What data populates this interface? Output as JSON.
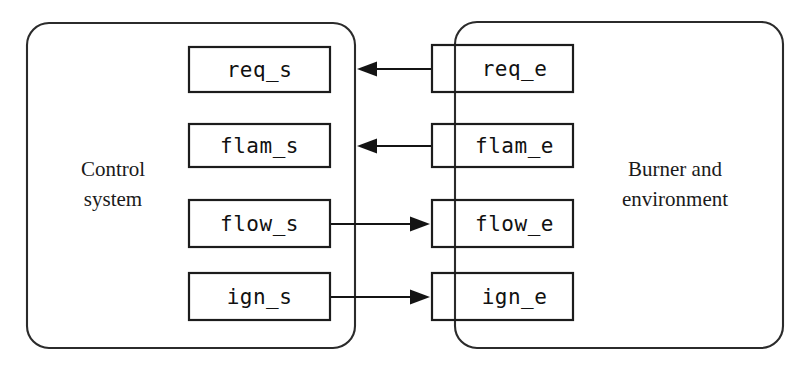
{
  "diagram": {
    "background_color": "#ffffff",
    "line_color": "#141414",
    "text_color": "#111111",
    "containers": [
      {
        "id": "control-system",
        "label_line1": "Control",
        "label_line2": "system",
        "x": 27,
        "y": 23,
        "width": 328,
        "height": 325,
        "radius": 22,
        "label_cx": 113,
        "label_y1": 176,
        "label_y2": 206
      },
      {
        "id": "burner-environment",
        "label_line1": "Burner and",
        "label_line2": "environment",
        "x": 455,
        "y": 22,
        "width": 328,
        "height": 326,
        "radius": 22,
        "label_cx": 675,
        "label_y1": 176,
        "label_y2": 206
      }
    ],
    "boxes": [
      {
        "id": "req-s",
        "label": "req_s",
        "x": 189,
        "y": 47,
        "width": 141,
        "height": 45,
        "side": "left"
      },
      {
        "id": "flam-s",
        "label": "flam_s",
        "x": 189,
        "y": 124,
        "width": 141,
        "height": 43,
        "side": "left"
      },
      {
        "id": "flow-s",
        "label": "flow_s",
        "x": 189,
        "y": 200,
        "width": 141,
        "height": 47,
        "side": "left"
      },
      {
        "id": "ign-s",
        "label": "ign_s",
        "x": 189,
        "y": 273,
        "width": 141,
        "height": 47,
        "side": "left"
      },
      {
        "id": "req-e",
        "label": "req_e",
        "x": 432,
        "y": 45,
        "width": 141,
        "height": 47,
        "side": "right"
      },
      {
        "id": "flam-e",
        "label": "flam_e",
        "x": 432,
        "y": 124,
        "width": 141,
        "height": 43,
        "side": "right"
      },
      {
        "id": "flow-e",
        "label": "flow_e",
        "x": 432,
        "y": 200,
        "width": 141,
        "height": 47,
        "side": "right"
      },
      {
        "id": "ign-e",
        "label": "ign_e",
        "x": 432,
        "y": 273,
        "width": 141,
        "height": 47,
        "side": "right"
      }
    ],
    "connectors": [
      {
        "id": "req-e-to-req-s",
        "from": "req_e",
        "to": "req_s",
        "direction": "left",
        "x1": 432,
        "x2": 357,
        "y": 69
      },
      {
        "id": "flam-e-to-flam-s",
        "from": "flam_e",
        "to": "flam_s",
        "direction": "left",
        "x1": 432,
        "x2": 357,
        "y": 146
      },
      {
        "id": "flow-s-to-flow-e",
        "from": "flow_s",
        "to": "flow_e",
        "direction": "right",
        "x1": 330,
        "x2": 430,
        "y": 224
      },
      {
        "id": "ign-s-to-ign-e",
        "from": "ign_s",
        "to": "ign_e",
        "direction": "right",
        "x1": 330,
        "x2": 430,
        "y": 297
      }
    ]
  }
}
